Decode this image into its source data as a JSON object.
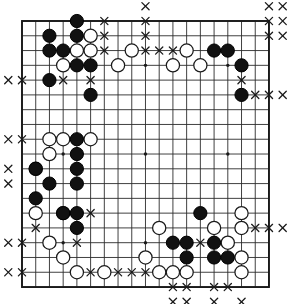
{
  "app": {
    "title": "Go Board Position",
    "board_type": "go-board",
    "board_size": 19,
    "description": "19x19 Go board diagram with black stones, white stones and territory X markers"
  },
  "colors": {
    "background": "#ffffff",
    "board_fill": "#ffffff",
    "grid_line": "#2b2b2b",
    "border_line": "#1a1a1a",
    "black_stone_fill": "#111111",
    "black_stone_edge": "#000000",
    "white_stone_fill": "#ffffff",
    "white_stone_edge": "#1a1a1a",
    "star_point": "#1a1a1a",
    "marker_x": "#1a1a1a"
  },
  "geometry": {
    "origin_x": 22,
    "origin_y": 21,
    "step_x": 13.72,
    "step_y": 14.78,
    "stone_radius": 6.6,
    "star_radius": 1.7,
    "marker_half": 3.6,
    "line_width": 0.9,
    "border_width": 1.9
  },
  "legend": {
    "black_label": "Black stone",
    "white_label": "White stone",
    "marker_label": "Territory marker (x)",
    "star_label": "Star point (hoshi)"
  },
  "star_points": [
    {
      "col": 4,
      "row": 4
    },
    {
      "col": 10,
      "row": 4
    },
    {
      "col": 16,
      "row": 4
    },
    {
      "col": 4,
      "row": 10
    },
    {
      "col": 10,
      "row": 10
    },
    {
      "col": 16,
      "row": 10
    },
    {
      "col": 4,
      "row": 16
    },
    {
      "col": 10,
      "row": 16
    },
    {
      "col": 16,
      "row": 16
    }
  ],
  "stones": {
    "black": [
      {
        "col": 5,
        "row": 1
      },
      {
        "col": 3,
        "row": 2
      },
      {
        "col": 5,
        "row": 2
      },
      {
        "col": 3,
        "row": 3
      },
      {
        "col": 4,
        "row": 3
      },
      {
        "col": 5,
        "row": 4
      },
      {
        "col": 6,
        "row": 4
      },
      {
        "col": 3,
        "row": 5
      },
      {
        "col": 6,
        "row": 6
      },
      {
        "col": 15,
        "row": 3
      },
      {
        "col": 16,
        "row": 3
      },
      {
        "col": 17,
        "row": 4
      },
      {
        "col": 17,
        "row": 6
      },
      {
        "col": 5,
        "row": 9
      },
      {
        "col": 5,
        "row": 10
      },
      {
        "col": 2,
        "row": 11
      },
      {
        "col": 5,
        "row": 11
      },
      {
        "col": 3,
        "row": 12
      },
      {
        "col": 5,
        "row": 12
      },
      {
        "col": 2,
        "row": 13
      },
      {
        "col": 4,
        "row": 14
      },
      {
        "col": 5,
        "row": 14
      },
      {
        "col": 5,
        "row": 15
      },
      {
        "col": 14,
        "row": 14
      },
      {
        "col": 12,
        "row": 16
      },
      {
        "col": 13,
        "row": 16
      },
      {
        "col": 15,
        "row": 16
      },
      {
        "col": 13,
        "row": 17
      },
      {
        "col": 15,
        "row": 17
      },
      {
        "col": 16,
        "row": 17
      }
    ],
    "white": [
      {
        "col": 6,
        "row": 2
      },
      {
        "col": 5,
        "row": 3
      },
      {
        "col": 6,
        "row": 3
      },
      {
        "col": 4,
        "row": 4
      },
      {
        "col": 8,
        "row": 4
      },
      {
        "col": 9,
        "row": 3
      },
      {
        "col": 13,
        "row": 3
      },
      {
        "col": 12,
        "row": 4
      },
      {
        "col": 14,
        "row": 4
      },
      {
        "col": 3,
        "row": 9
      },
      {
        "col": 4,
        "row": 9
      },
      {
        "col": 6,
        "row": 9
      },
      {
        "col": 3,
        "row": 10
      },
      {
        "col": 2,
        "row": 11
      },
      {
        "col": 2,
        "row": 14
      },
      {
        "col": 4,
        "row": 14
      },
      {
        "col": 3,
        "row": 16
      },
      {
        "col": 4,
        "row": 17
      },
      {
        "col": 5,
        "row": 18
      },
      {
        "col": 7,
        "row": 18
      },
      {
        "col": 11,
        "row": 15
      },
      {
        "col": 10,
        "row": 17
      },
      {
        "col": 12,
        "row": 18
      },
      {
        "col": 13,
        "row": 18
      },
      {
        "col": 15,
        "row": 15
      },
      {
        "col": 16,
        "row": 16
      },
      {
        "col": 17,
        "row": 14
      },
      {
        "col": 17,
        "row": 15
      },
      {
        "col": 17,
        "row": 17
      },
      {
        "col": 17,
        "row": 18
      },
      {
        "col": 11,
        "row": 18
      }
    ]
  },
  "markers": [
    {
      "col": 10,
      "row": 0
    },
    {
      "col": 19,
      "row": 0
    },
    {
      "col": 20,
      "row": 0
    },
    {
      "col": 7,
      "row": 1
    },
    {
      "col": 10,
      "row": 1
    },
    {
      "col": 19,
      "row": 1
    },
    {
      "col": 20,
      "row": 1
    },
    {
      "col": 7,
      "row": 2
    },
    {
      "col": 10,
      "row": 2
    },
    {
      "col": 19,
      "row": 2
    },
    {
      "col": 20,
      "row": 2
    },
    {
      "col": 7,
      "row": 3
    },
    {
      "col": 10,
      "row": 3
    },
    {
      "col": 11,
      "row": 3
    },
    {
      "col": 12,
      "row": 3
    },
    {
      "col": 0,
      "row": 5
    },
    {
      "col": 1,
      "row": 5
    },
    {
      "col": 4,
      "row": 5
    },
    {
      "col": 6,
      "row": 5
    },
    {
      "col": 17,
      "row": 5
    },
    {
      "col": 6,
      "row": 6
    },
    {
      "col": 18,
      "row": 6
    },
    {
      "col": 19,
      "row": 6
    },
    {
      "col": 20,
      "row": 6
    },
    {
      "col": 0,
      "row": 9
    },
    {
      "col": 1,
      "row": 9
    },
    {
      "col": 0,
      "row": 11
    },
    {
      "col": 0,
      "row": 12
    },
    {
      "col": 6,
      "row": 14
    },
    {
      "col": 2,
      "row": 15
    },
    {
      "col": 18,
      "row": 15
    },
    {
      "col": 19,
      "row": 15
    },
    {
      "col": 20,
      "row": 15
    },
    {
      "col": 0,
      "row": 16
    },
    {
      "col": 1,
      "row": 16
    },
    {
      "col": 5,
      "row": 16
    },
    {
      "col": 14,
      "row": 16
    },
    {
      "col": 16,
      "row": 16
    },
    {
      "col": 0,
      "row": 18
    },
    {
      "col": 1,
      "row": 18
    },
    {
      "col": 6,
      "row": 18
    },
    {
      "col": 8,
      "row": 18
    },
    {
      "col": 9,
      "row": 18
    },
    {
      "col": 10,
      "row": 18
    },
    {
      "col": 12,
      "row": 19
    },
    {
      "col": 13,
      "row": 19
    },
    {
      "col": 15,
      "row": 19
    },
    {
      "col": 16,
      "row": 19
    },
    {
      "col": 12,
      "row": 20
    },
    {
      "col": 13,
      "row": 20
    },
    {
      "col": 15,
      "row": 20
    },
    {
      "col": 17,
      "row": 20
    }
  ]
}
